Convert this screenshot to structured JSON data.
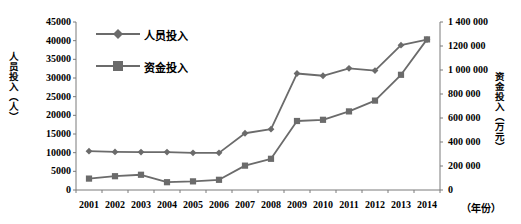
{
  "chart_data": {
    "type": "line",
    "title": "",
    "xlabel": "（年份）",
    "categories": [
      "2001",
      "2002",
      "2003",
      "2004",
      "2005",
      "2006",
      "2007",
      "2008",
      "2009",
      "2010",
      "2011",
      "2012",
      "2013",
      "2014"
    ],
    "grid": false,
    "legend_position": "top-left",
    "series": [
      {
        "name": "人员投入",
        "axis": "left",
        "marker": "diamond",
        "color": "#6b6b6b",
        "values": [
          10400,
          10200,
          10150,
          10150,
          9950,
          9950,
          15200,
          16300,
          31200,
          30600,
          32600,
          32000,
          38800,
          40300
        ]
      },
      {
        "name": "资金投入",
        "axis": "right",
        "marker": "square",
        "color": "#6b6b6b",
        "values": [
          95000,
          115000,
          127000,
          65000,
          72000,
          85000,
          203000,
          260000,
          575000,
          585000,
          655000,
          745000,
          960000,
          1255000
        ]
      }
    ],
    "left_axis": {
      "label": "人员投入（人）",
      "ticks": [
        "0",
        "5000",
        "10000",
        "15000",
        "20000",
        "25000",
        "30000",
        "35000",
        "40000",
        "45000"
      ],
      "min": 0,
      "max": 45000,
      "step": 5000
    },
    "right_axis": {
      "label": "资金投入（万元）",
      "ticks": [
        "0",
        "200 000",
        "400 000",
        "600 000",
        "800 000",
        "1 000 000",
        "1200 000",
        "1 400 000"
      ],
      "min": 0,
      "max": 1400000,
      "step": 200000
    }
  }
}
